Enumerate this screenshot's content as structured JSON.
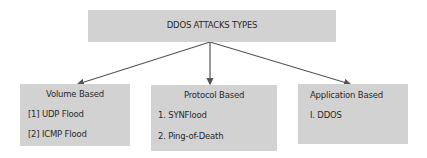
{
  "root": {
    "label": "DDOS ATTACKS TYPES"
  },
  "categories": [
    {
      "title": "Volume Based",
      "items": [
        "[1] UDP Flood",
        "[2] ICMP Flood"
      ]
    },
    {
      "title": "Protocol Based",
      "items": [
        "1. SYNFlood",
        "2. Ping-of-Death"
      ]
    },
    {
      "title": "Application Based",
      "items": [
        "I. DDOS"
      ]
    }
  ],
  "colors": {
    "box_fill": "#d2d2d2",
    "arrow": "#555555",
    "text": "#2a2a2a"
  }
}
